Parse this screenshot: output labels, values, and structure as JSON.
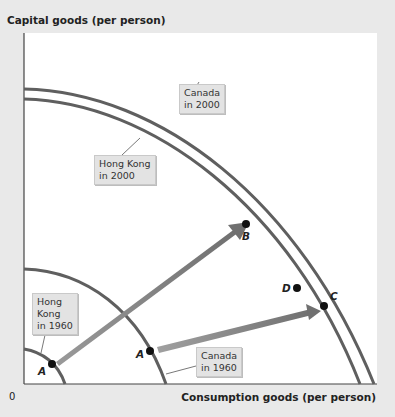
{
  "axes": {
    "y_label": "Capital goods (per person)",
    "x_label": "Consumption goods (per person)",
    "origin": "0"
  },
  "curves": [
    {
      "id": "canada-2000",
      "label": "Canada\nin 2000"
    },
    {
      "id": "hongkong-2000",
      "label": "Hong Kong\nin 2000"
    },
    {
      "id": "canada-1960",
      "label": "Canada\nin 1960"
    },
    {
      "id": "hongkong-1960",
      "label": "Hong\nKong\nin 1960"
    }
  ],
  "points": {
    "a_hk": "A",
    "a_canada": "A",
    "b": "B",
    "c": "C",
    "d": "D"
  },
  "colors": {
    "curve": "#5f5f5f",
    "arrow": "#8a8a8a",
    "background": "#e9e9e9",
    "plot": "#ffffff"
  }
}
